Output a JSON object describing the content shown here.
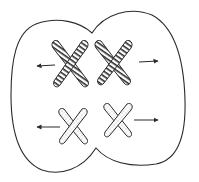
{
  "diagram": {
    "colors": {
      "stroke": "#2a2a2a",
      "background": "#ffffff"
    },
    "cell": {
      "shape": "two-lobed cell membrane pinching in the middle"
    },
    "chromosomes": [
      {
        "id": "striped-left",
        "pattern": "striped",
        "cx": 70,
        "cy": 63,
        "scale": 1.0,
        "direction": "left"
      },
      {
        "id": "striped-right",
        "pattern": "striped",
        "cx": 113,
        "cy": 62,
        "scale": 1.0,
        "direction": "right"
      },
      {
        "id": "dotted-left",
        "pattern": "dotted",
        "cx": 73,
        "cy": 126,
        "scale": 0.8,
        "direction": "left"
      },
      {
        "id": "dotted-right",
        "pattern": "dotted",
        "cx": 117,
        "cy": 120,
        "scale": 0.8,
        "direction": "right"
      }
    ],
    "arrows": [
      {
        "id": "arrow-top-left",
        "x1": 55,
        "y1": 65,
        "x2": 37,
        "y2": 66
      },
      {
        "id": "arrow-top-right",
        "x1": 139,
        "y1": 62,
        "x2": 158,
        "y2": 61
      },
      {
        "id": "arrow-bottom-left",
        "x1": 60,
        "y1": 127,
        "x2": 37,
        "y2": 127
      },
      {
        "id": "arrow-bottom-right",
        "x1": 134,
        "y1": 120,
        "x2": 158,
        "y2": 120
      }
    ]
  }
}
